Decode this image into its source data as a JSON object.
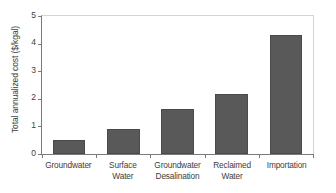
{
  "chart_data": {
    "type": "bar",
    "title": "",
    "xlabel": "",
    "ylabel": "Total annualized cost ($/kgal)",
    "categories": [
      "Groundwater",
      "Surface Water",
      "Groundwater Desalination",
      "Reclaimed Water",
      "Importation"
    ],
    "category_lines": [
      [
        "Groundwater"
      ],
      [
        "Surface",
        "Water"
      ],
      [
        "Groundwater",
        "Desalination"
      ],
      [
        "Reclaimed",
        "Water"
      ],
      [
        "Importation"
      ]
    ],
    "values": [
      0.5,
      0.9,
      1.63,
      2.17,
      4.3
    ],
    "ylim": [
      0,
      5
    ],
    "y_ticks": [
      0,
      1,
      2,
      3,
      4,
      5
    ],
    "y_tick_labels": [
      "0",
      "1",
      "2",
      "3",
      "4",
      "5"
    ],
    "grid": false,
    "legend": null,
    "bar_color": "#595959",
    "bar_edge_color": "#4a4a4a",
    "axis_color": "#7a7a7a",
    "frame_color": "#d4d4d4",
    "text_color": "#3d3d3d",
    "background": "#ffffff"
  }
}
